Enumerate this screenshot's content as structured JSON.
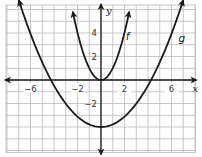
{
  "chart_data": {
    "type": "line",
    "title": "",
    "xlabel": "x",
    "ylabel": "y",
    "xlim": [
      -8,
      8
    ],
    "ylim": [
      -6,
      6
    ],
    "grid": true,
    "grid_step": 1,
    "x_ticks": [
      {
        "value": -6,
        "label": "−6"
      },
      {
        "value": -2,
        "label": "−2"
      },
      {
        "value": 2,
        "label": "2"
      },
      {
        "value": 6,
        "label": "6"
      }
    ],
    "y_ticks": [
      {
        "value": 4,
        "label": "4"
      },
      {
        "value": 2,
        "label": "2"
      },
      {
        "value": -2,
        "label": "−2"
      }
    ],
    "series": [
      {
        "name": "f",
        "label": "f",
        "equation_estimate": "y = x^2",
        "vertex": [
          0,
          0
        ],
        "x": [
          -2.4,
          -2,
          -1,
          0,
          1,
          2,
          2.4
        ],
        "y": [
          5.8,
          4,
          1,
          0,
          1,
          4,
          5.8
        ],
        "label_position": [
          2.1,
          3.4
        ],
        "arrows": "both-ends-up"
      },
      {
        "name": "g",
        "label": "g",
        "equation_estimate": "y = 0.22x^2 - 4",
        "vertex": [
          0,
          -4
        ],
        "x_intercepts": [
          -4.25,
          4.25
        ],
        "x": [
          -7,
          -6,
          -4,
          -2,
          0,
          2,
          4,
          6,
          7
        ],
        "y": [
          6.8,
          3.9,
          -0.5,
          -3.1,
          -4,
          -3.1,
          -0.5,
          3.9,
          6.8
        ],
        "label_position": [
          6.6,
          3.2
        ],
        "arrows": "both-ends-up"
      }
    ],
    "legend": "none; curves labeled inline"
  },
  "axes": {
    "x_label": "x",
    "y_label": "y"
  },
  "curves": {
    "f_label": "f",
    "g_label": "g"
  }
}
